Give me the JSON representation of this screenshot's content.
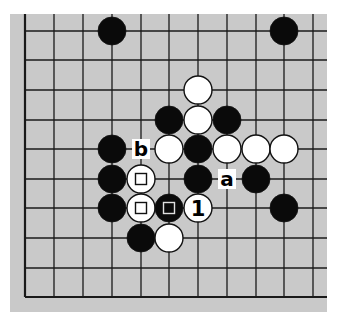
{
  "diagram": {
    "type": "go-board-diagram",
    "board_color": "#c9c9c9",
    "line_color": "#1a1a1a",
    "black_color": "#0a0a0a",
    "white_color": "#ffffff",
    "columns_x": [
      25,
      54,
      83,
      112,
      141,
      169,
      198,
      227,
      256,
      284,
      313
    ],
    "rows_y": [
      31,
      60,
      90,
      120,
      149,
      179,
      208,
      238,
      268,
      297
    ],
    "edges": {
      "left": true,
      "bottom": true,
      "top": false,
      "right": false
    },
    "stones": [
      {
        "color": "black",
        "col": 3,
        "row": 0
      },
      {
        "color": "black",
        "col": 9,
        "row": 0
      },
      {
        "color": "white",
        "col": 6,
        "row": 2
      },
      {
        "color": "black",
        "col": 5,
        "row": 3
      },
      {
        "color": "white",
        "col": 6,
        "row": 3
      },
      {
        "color": "black",
        "col": 7,
        "row": 3
      },
      {
        "color": "black",
        "col": 3,
        "row": 4
      },
      {
        "color": "white",
        "col": 5,
        "row": 4
      },
      {
        "color": "black",
        "col": 6,
        "row": 4
      },
      {
        "color": "white",
        "col": 7,
        "row": 4
      },
      {
        "color": "white",
        "col": 8,
        "row": 4
      },
      {
        "color": "white",
        "col": 9,
        "row": 4
      },
      {
        "color": "black",
        "col": 3,
        "row": 5
      },
      {
        "color": "white",
        "col": 4,
        "row": 5,
        "mark": "square"
      },
      {
        "color": "black",
        "col": 6,
        "row": 5
      },
      {
        "color": "black",
        "col": 8,
        "row": 5
      },
      {
        "color": "black",
        "col": 3,
        "row": 6
      },
      {
        "color": "white",
        "col": 4,
        "row": 6,
        "mark": "square"
      },
      {
        "color": "black",
        "col": 5,
        "row": 6,
        "mark": "square"
      },
      {
        "color": "white",
        "col": 6,
        "row": 6,
        "label": "1"
      },
      {
        "color": "black",
        "col": 9,
        "row": 6
      },
      {
        "color": "black",
        "col": 4,
        "row": 7
      },
      {
        "color": "white",
        "col": 5,
        "row": 7
      }
    ],
    "point_labels": [
      {
        "text": "b",
        "col": 4,
        "row": 4
      },
      {
        "text": "a",
        "col": 7,
        "row": 5
      }
    ]
  }
}
